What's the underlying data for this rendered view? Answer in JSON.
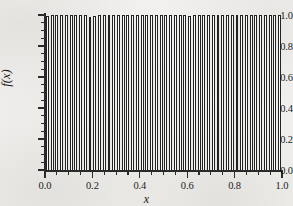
{
  "chart_data": {
    "type": "bar",
    "title": "",
    "xlabel": "x",
    "ylabel": "f(x)",
    "xlim": [
      0.0,
      1.0
    ],
    "ylim": [
      0.0,
      1.0
    ],
    "grid": false,
    "legend": null,
    "x_ticks": [
      "0.0",
      "0.2",
      "0.4",
      "0.6",
      "0.8",
      "1.0"
    ],
    "x_tick_values": [
      0.0,
      0.2,
      0.4,
      0.6,
      0.8,
      1.0
    ],
    "y_ticks": [
      "0.0",
      "0.2",
      "0.4",
      "0.6",
      "0.8",
      "1.0"
    ],
    "y_tick_values": [
      0.0,
      0.2,
      0.4,
      0.6,
      0.8,
      1.0
    ],
    "x_minor_tick_interval": 0.05,
    "y_minor_tick_interval": 0.05,
    "n_bars": 50,
    "bar_width_fraction": 0.62,
    "x": [
      0.01,
      0.03,
      0.05,
      0.07,
      0.09,
      0.11,
      0.13,
      0.15,
      0.17,
      0.19,
      0.21,
      0.23,
      0.25,
      0.27,
      0.29,
      0.31,
      0.33,
      0.35,
      0.37,
      0.39,
      0.41,
      0.43,
      0.45,
      0.47,
      0.49,
      0.51,
      0.53,
      0.55,
      0.57,
      0.59,
      0.61,
      0.63,
      0.65,
      0.67,
      0.69,
      0.71,
      0.73,
      0.75,
      0.77,
      0.79,
      0.81,
      0.83,
      0.85,
      0.87,
      0.89,
      0.91,
      0.93,
      0.95,
      0.97,
      0.99
    ],
    "values": [
      0.995,
      1.0,
      1.002,
      1.001,
      0.999,
      1.003,
      1.004,
      1.002,
      0.998,
      0.988,
      0.992,
      1.009,
      1.01,
      1.004,
      1.0,
      0.999,
      1.002,
      1.003,
      1.001,
      1.006,
      1.007,
      1.004,
      1.001,
      0.998,
      1.0,
      1.002,
      1.001,
      0.999,
      1.003,
      0.997,
      0.995,
      1.001,
      1.004,
      1.005,
      1.002,
      1.0,
      0.998,
      1.001,
      1.005,
      1.006,
      1.003,
      1.0,
      0.997,
      1.0,
      1.004,
      1.008,
      1.009,
      1.005,
      1.001,
      0.999
    ],
    "series_name": "f(x)",
    "bar_facecolor": "#ffffff",
    "bar_edgecolor": "#232323",
    "axis_color": "#2a2a2a",
    "background_color": "#f2f1ef"
  }
}
